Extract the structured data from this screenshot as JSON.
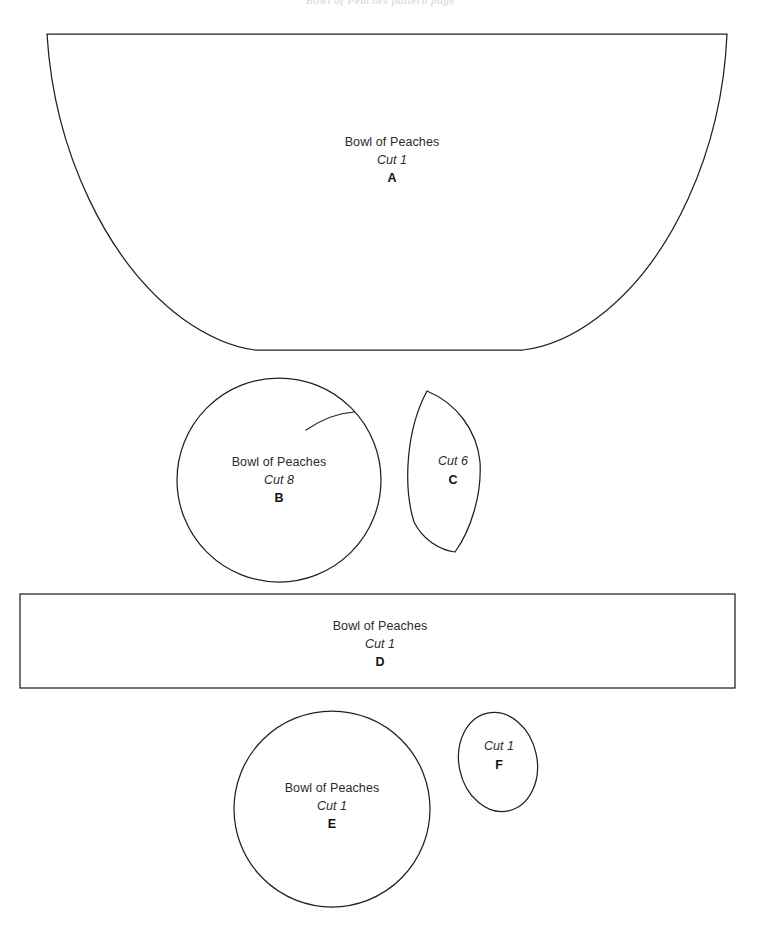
{
  "page": {
    "scan_header_text": "Bowl of Peaches pattern page",
    "width": 761,
    "height": 947,
    "background_color": "#ffffff",
    "line_color": "#231f20"
  },
  "pattern_name": "Bowl of Peaches",
  "pieces": [
    {
      "id": "A",
      "shape": "bowl",
      "name_label": "Bowl of Peaches",
      "cut_label": "Cut 1",
      "letter": "A",
      "label_left": 342,
      "label_top": 136
    },
    {
      "id": "B",
      "shape": "peach-circle-with-crease",
      "name_label": "Bowl of Peaches",
      "cut_label": "Cut 8",
      "letter": "B",
      "label_left": 219,
      "label_top": 456
    },
    {
      "id": "C",
      "shape": "leaf",
      "name_label": "",
      "cut_label": "Cut 6",
      "letter": "C",
      "label_left": 424,
      "label_top": 455
    },
    {
      "id": "D",
      "shape": "rectangle",
      "name_label": "Bowl of Peaches",
      "cut_label": "Cut 1",
      "letter": "D",
      "label_left": 330,
      "label_top": 620
    },
    {
      "id": "E",
      "shape": "circle",
      "name_label": "Bowl of Peaches",
      "cut_label": "Cut 1",
      "letter": "E",
      "label_left": 277,
      "label_top": 782
    },
    {
      "id": "F",
      "shape": "ellipse",
      "name_label": "",
      "cut_label": "Cut 1",
      "letter": "F",
      "label_left": 478,
      "label_top": 740
    }
  ]
}
